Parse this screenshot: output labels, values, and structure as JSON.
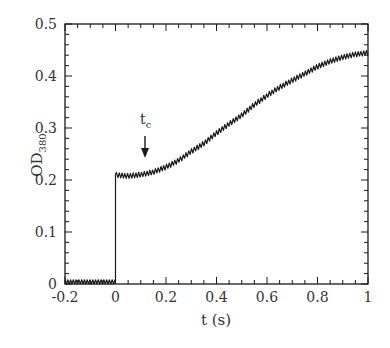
{
  "chart_data": {
    "type": "line",
    "title": "",
    "xlabel": "t (s)",
    "ylabel": "OD",
    "ylabel_subscript": "380",
    "xlim": [
      -0.2,
      1.0
    ],
    "ylim": [
      0,
      0.5
    ],
    "xticks": [
      -0.2,
      0,
      0.2,
      0.4,
      0.6,
      0.8,
      1
    ],
    "xtick_labels": [
      "-0.2",
      "0",
      "0.2",
      "0.4",
      "0.6",
      "0.8",
      "1"
    ],
    "yticks": [
      0,
      0.1,
      0.2,
      0.3,
      0.4,
      0.5
    ],
    "ytick_labels": [
      "0",
      "0.1",
      "0.2",
      "0.3",
      "0.4",
      "0.5"
    ],
    "x_minor_step": 0.05,
    "y_minor_step": 0.02,
    "grid": false,
    "legend": null,
    "series": [
      {
        "name": "OD380",
        "color": "#1a1a1a",
        "noise_amplitude": 0.006,
        "x": [
          -0.2,
          -0.1,
          0.0,
          0.0,
          0.05,
          0.1,
          0.15,
          0.2,
          0.25,
          0.3,
          0.35,
          0.4,
          0.45,
          0.5,
          0.55,
          0.6,
          0.65,
          0.7,
          0.75,
          0.8,
          0.85,
          0.9,
          0.95,
          1.0
        ],
        "values": [
          0.005,
          0.005,
          0.005,
          0.21,
          0.208,
          0.21,
          0.215,
          0.225,
          0.238,
          0.255,
          0.27,
          0.29,
          0.308,
          0.325,
          0.345,
          0.362,
          0.378,
          0.392,
          0.405,
          0.418,
          0.428,
          0.436,
          0.442,
          0.445
        ]
      }
    ],
    "annotations": [
      {
        "text": "t",
        "subscript": "c",
        "x": 0.12,
        "y_arrow_tip": 0.24,
        "type": "down-arrow"
      }
    ]
  },
  "labels": {
    "xlabel": "t (s)",
    "ylabel_main": "OD",
    "ylabel_sub": "380",
    "annotation_main": "t",
    "annotation_sub": "c"
  }
}
